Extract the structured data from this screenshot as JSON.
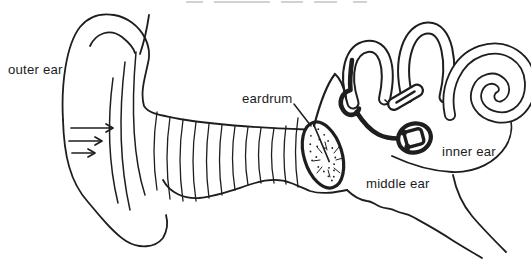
{
  "figure": {
    "type": "line-drawing",
    "background": "#ffffff",
    "line_color": "#1e1e1e",
    "text_color": "#1c1c1c",
    "labels": {
      "outer_ear": "outer ear",
      "eardrum": "eardrum",
      "middle_ear": "middle ear",
      "inner_ear": "inner ear"
    },
    "sound_wave_arrows": {
      "count": 3,
      "direction": "right"
    }
  }
}
